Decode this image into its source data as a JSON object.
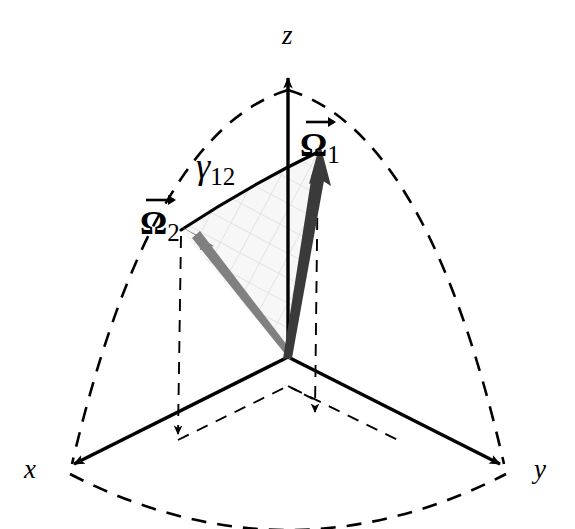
{
  "figure": {
    "width": 575,
    "height": 529,
    "background_color": "#ffffff"
  },
  "axes": {
    "x": {
      "label": "x",
      "origin": [
        288,
        357
      ],
      "tip": [
        62,
        470
      ],
      "color": "#000000",
      "style": "solid"
    },
    "y": {
      "label": "y",
      "origin": [
        288,
        357
      ],
      "tip": [
        512,
        470
      ],
      "color": "#000000",
      "style": "solid"
    },
    "z": {
      "label": "z",
      "origin": [
        288,
        357
      ],
      "tip": [
        288,
        68
      ],
      "color": "#000000",
      "style": "solid"
    }
  },
  "vectors": [
    {
      "id": "omega1",
      "symbol": "Ω",
      "subscript": "1",
      "label": "Ω₁",
      "has_vector_arrow": true,
      "origin": [
        288,
        357
      ],
      "tip": [
        318,
        150
      ],
      "color": "#3a3a3a",
      "label_position": [
        300,
        118
      ]
    },
    {
      "id": "omega2",
      "symbol": "Ω",
      "subscript": "2",
      "label": "Ω₂",
      "has_vector_arrow": true,
      "origin": [
        288,
        357
      ],
      "tip": [
        181,
        230
      ],
      "color": "#808080",
      "label_position": [
        139,
        196
      ]
    }
  ],
  "angle": {
    "id": "gamma12",
    "symbol": "γ",
    "subscript": "12",
    "label": "γ₁₂",
    "label_position": [
      196,
      152
    ],
    "arc_from": "omega2",
    "arc_to": "omega1",
    "color": "#000000",
    "style": "solid"
  },
  "sphere": {
    "radius_px": 289,
    "center": [
      288,
      357
    ],
    "meridian_arcs": [
      {
        "name": "meridian-xz",
        "from": "z-tip",
        "to": "x-tip",
        "style": "dashed"
      },
      {
        "name": "meridian-yz",
        "from": "z-tip",
        "to": "y-tip",
        "style": "dashed"
      }
    ],
    "equator_arc": {
      "name": "equator-xy",
      "from": "x-tip",
      "to": "y-tip",
      "style": "dashed"
    },
    "octant_fill": "#f2f2f2",
    "hatch_color": "#dcdcdc",
    "dash_color": "#000000"
  },
  "projections": [
    {
      "name": "omega1-drop-line",
      "from": [
        318,
        150
      ],
      "to": [
        315,
        418
      ],
      "style": "dashed",
      "arrowhead": true
    },
    {
      "name": "omega2-drop-line",
      "from": [
        181,
        230
      ],
      "to": [
        178,
        440
      ],
      "style": "dashed",
      "arrowhead": true
    },
    {
      "name": "base-parallelogram",
      "style": "dashed",
      "arrowhead": false
    }
  ],
  "colors": {
    "stroke": "#000000",
    "omega1": "#3a3a3a",
    "omega2": "#808080",
    "hatch": "#dcdcdc",
    "octant": "#f4f4f4"
  }
}
